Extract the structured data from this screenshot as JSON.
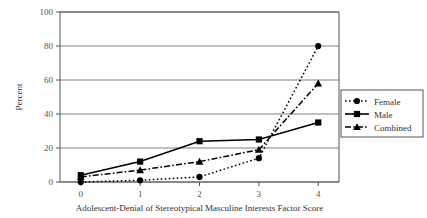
{
  "chart_data": {
    "type": "line",
    "title": "",
    "xlabel": "Adolescent-Denial of Stereotypical Masculine Interests Factor Score",
    "ylabel": "Percent",
    "x": [
      0,
      1,
      2,
      3,
      4
    ],
    "xticklabels": [
      "0",
      "1",
      "2",
      "3",
      "4"
    ],
    "yticklabels": [
      "0",
      "20",
      "40",
      "60",
      "80",
      "100"
    ],
    "ylim": [
      0,
      100
    ],
    "xlim": [
      -0.35,
      4.35
    ],
    "grid": "horizontal",
    "legend_position": "right",
    "series": [
      {
        "name": "Female",
        "values": [
          0,
          1,
          3,
          14,
          80
        ],
        "marker": "circle",
        "linestyle": "dotted",
        "color": "#000000"
      },
      {
        "name": "Male",
        "values": [
          4,
          12,
          24,
          25,
          35
        ],
        "marker": "square",
        "linestyle": "solid",
        "color": "#000000"
      },
      {
        "name": "Combined",
        "values": [
          3,
          7,
          12,
          19,
          58
        ],
        "marker": "triangle",
        "linestyle": "dashdot",
        "color": "#000000"
      }
    ]
  },
  "legend": {
    "items": [
      {
        "label": "Female"
      },
      {
        "label": "Male"
      },
      {
        "label": "Combined"
      }
    ]
  },
  "colors": {
    "axis": "#555555",
    "grid": "#808080",
    "series": "#000000",
    "background": "#ffffff"
  }
}
